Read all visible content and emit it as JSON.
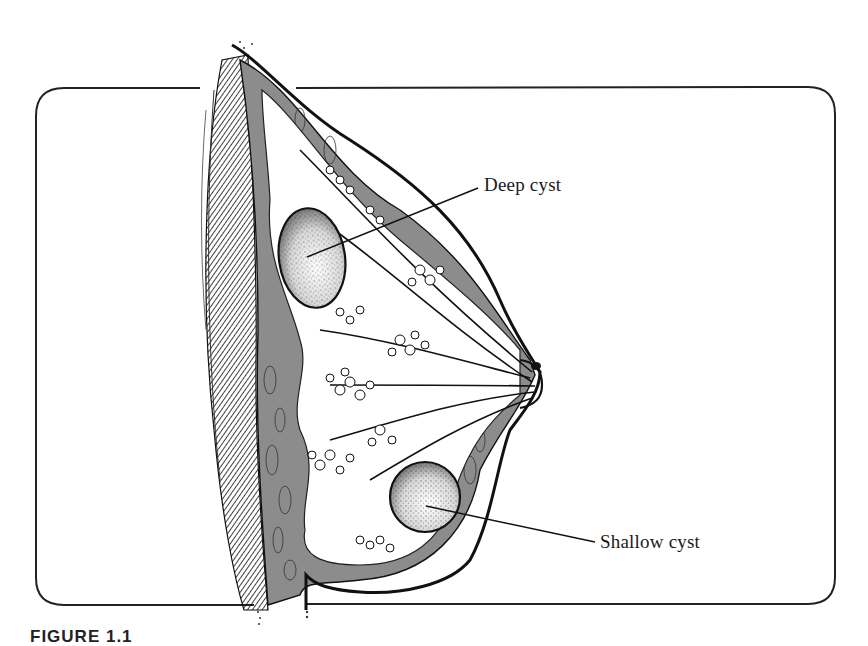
{
  "figure": {
    "caption_visible": "FIGURE 1.1",
    "labels": [
      {
        "id": "deep",
        "text": "Deep cyst"
      },
      {
        "id": "shallow",
        "text": "Shallow cyst"
      }
    ],
    "colors": {
      "ink": "#1a1a1a",
      "tissue_gray": "#8c8c8c",
      "paper": "#ffffff"
    }
  }
}
